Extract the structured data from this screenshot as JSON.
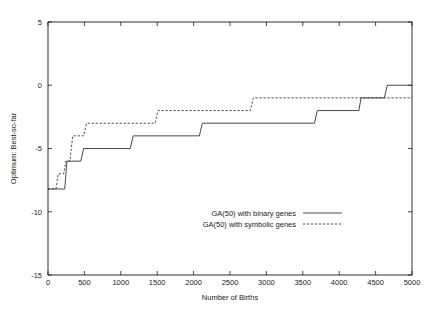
{
  "chart_data": {
    "type": "line",
    "title": "",
    "xlabel": "Number of Births",
    "ylabel": "Optimum: Best-so-far",
    "xlim": [
      0,
      5000
    ],
    "ylim": [
      -15,
      5
    ],
    "xticks": [
      0,
      500,
      1000,
      1500,
      2000,
      2500,
      3000,
      3500,
      4000,
      4500,
      5000
    ],
    "xtick_labels": [
      "0",
      "500",
      "1000",
      "1500",
      "2000",
      "2500",
      "3000",
      "3500",
      "4000",
      "4500",
      "5000"
    ],
    "yticks": [
      5,
      0,
      -5,
      -10,
      -15
    ],
    "ytick_labels": [
      "5",
      "0",
      "-5",
      "-10",
      "-15"
    ],
    "grid": false,
    "legend_position": "center",
    "line_color": "#1a1a1a",
    "axis_color": "#1a1a1a",
    "background": "#ffffff",
    "series": [
      {
        "name": "GA(50) with binary genes",
        "style": "solid",
        "x": [
          0,
          230,
          260,
          450,
          490,
          1130,
          1170,
          2080,
          2120,
          3660,
          3700,
          4270,
          4300,
          4620,
          4660,
          5000
        ],
        "y": [
          -8.2,
          -8.2,
          -6.0,
          -6.0,
          -5.0,
          -5.0,
          -4.0,
          -4.0,
          -3.0,
          -3.0,
          -2.0,
          -2.0,
          -1.0,
          -1.0,
          0.0,
          0.0
        ]
      },
      {
        "name": "GA(50) with symbolic genes",
        "style": "dashed",
        "x": [
          0,
          110,
          140,
          215,
          245,
          300,
          340,
          490,
          530,
          1470,
          1510,
          2780,
          2820,
          5000
        ],
        "y": [
          -8.2,
          -8.2,
          -7.0,
          -7.0,
          -6.0,
          -6.0,
          -4.0,
          -4.0,
          -3.0,
          -3.0,
          -2.0,
          -2.0,
          -1.0,
          -1.0
        ]
      }
    ]
  },
  "legend": {
    "entries": [
      {
        "label": "GA(50) with binary genes",
        "style": "solid"
      },
      {
        "label": "GA(50) with symbolic genes",
        "style": "dashed"
      }
    ]
  },
  "axes": {
    "x_title": "Number of Births",
    "y_title": "Optimum: Best-so-far"
  }
}
